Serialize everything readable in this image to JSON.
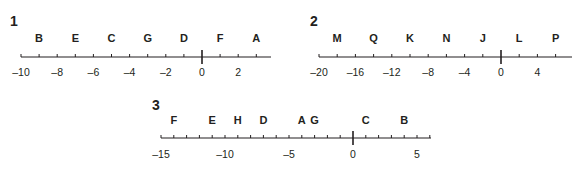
{
  "chart_data": [
    {
      "type": "number-line",
      "title": "1",
      "min": -10,
      "max": 3.5,
      "tick_step": 1,
      "tick_labels": [
        -10,
        -8,
        -6,
        -4,
        -2,
        0,
        2
      ],
      "points": [
        {
          "label": "B",
          "value": -9
        },
        {
          "label": "E",
          "value": -7
        },
        {
          "label": "C",
          "value": -5
        },
        {
          "label": "G",
          "value": -3
        },
        {
          "label": "D",
          "value": -1
        },
        {
          "label": "F",
          "value": 1
        },
        {
          "label": "A",
          "value": 3
        }
      ]
    },
    {
      "type": "number-line",
      "title": "2",
      "min": -20,
      "max": 7.5,
      "tick_step": 2,
      "tick_labels": [
        -20,
        -16,
        -12,
        -8,
        -4,
        0,
        4
      ],
      "points": [
        {
          "label": "M",
          "value": -18
        },
        {
          "label": "Q",
          "value": -14
        },
        {
          "label": "K",
          "value": -10
        },
        {
          "label": "N",
          "value": -6
        },
        {
          "label": "J",
          "value": -2
        },
        {
          "label": "L",
          "value": 2
        },
        {
          "label": "P",
          "value": 6
        }
      ]
    },
    {
      "type": "number-line",
      "title": "3",
      "min": -15,
      "max": 6,
      "tick_step": 1,
      "tick_labels": [
        -15,
        -10,
        -5,
        0,
        5
      ],
      "points": [
        {
          "label": "F",
          "value": -14
        },
        {
          "label": "E",
          "value": -11
        },
        {
          "label": "H",
          "value": -9
        },
        {
          "label": "D",
          "value": -7
        },
        {
          "label": "A",
          "value": -4
        },
        {
          "label": "G",
          "value": -3
        },
        {
          "label": "C",
          "value": 1
        },
        {
          "label": "B",
          "value": 4
        }
      ]
    }
  ],
  "panels": [
    {
      "number": "1"
    },
    {
      "number": "2"
    },
    {
      "number": "3"
    }
  ],
  "colors": {
    "ink": "#231f20",
    "background": "#ffffff"
  }
}
